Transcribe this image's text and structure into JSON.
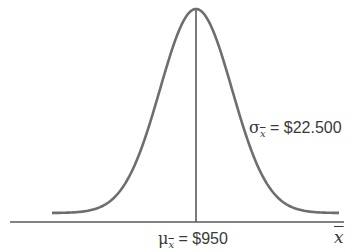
{
  "chart_data": {
    "type": "line",
    "title": "",
    "distribution": "normal",
    "mean": 950,
    "std_error": 22.5,
    "xlabel": "x̄",
    "ylabel": "",
    "grid": false,
    "legend": null,
    "annotations": [
      {
        "text": "σx̄ = $22.500",
        "position": "right of curve, mid-height"
      },
      {
        "text": "μx̄ = $950",
        "position": "below axis at center line"
      }
    ],
    "center_line": true
  },
  "labels": {
    "sigma": {
      "symbol": "σ",
      "subscript": "x",
      "equals_value": " = $22.500"
    },
    "mu": {
      "symbol": "μ",
      "subscript": "x",
      "equals_value": " = $950"
    },
    "x_axis": "x"
  },
  "colors": {
    "curve": "#6e6e6e",
    "axis": "#5a5a5a",
    "text": "#3a3a3a"
  }
}
